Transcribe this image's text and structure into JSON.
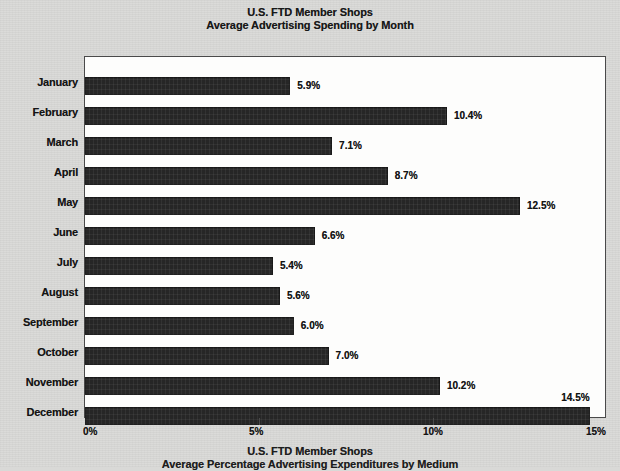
{
  "top_title": {
    "line1": "U.S. FTD Member Shops",
    "line2": "Average Advertising Spending by Month"
  },
  "bottom_title": {
    "line1": "U.S. FTD Member Shops",
    "line2": "Average Percentage Advertising Expenditures by Medium"
  },
  "axis": {
    "x_ticks": [
      "0%",
      "5%",
      "10%",
      "15%"
    ]
  },
  "chart_data": {
    "type": "bar",
    "orientation": "horizontal",
    "title": "U.S. FTD Member Shops\nAverage Advertising Spending by Month",
    "xlabel": "",
    "ylabel": "",
    "xlim": [
      0,
      15
    ],
    "xticks": [
      0,
      5,
      10,
      15
    ],
    "xtick_labels": [
      "0%",
      "5%",
      "10%",
      "15%"
    ],
    "grid": false,
    "legend": null,
    "bar_color": "#262626",
    "categories": [
      "January",
      "February",
      "March",
      "April",
      "May",
      "June",
      "July",
      "August",
      "September",
      "October",
      "November",
      "December"
    ],
    "values": [
      5.9,
      10.4,
      7.1,
      8.7,
      12.5,
      6.6,
      5.4,
      5.6,
      6.0,
      7.0,
      10.2,
      14.5
    ],
    "value_labels": [
      "5.9%",
      "10.4%",
      "7.1%",
      "8.7%",
      "12.5%",
      "6.6%",
      "5.4%",
      "5.6%",
      "6.0%",
      "7.0%",
      "10.2%",
      "14.5%"
    ],
    "label_placement": [
      "right",
      "right",
      "right",
      "right",
      "right",
      "right",
      "right",
      "right",
      "right",
      "right",
      "right",
      "above"
    ]
  }
}
